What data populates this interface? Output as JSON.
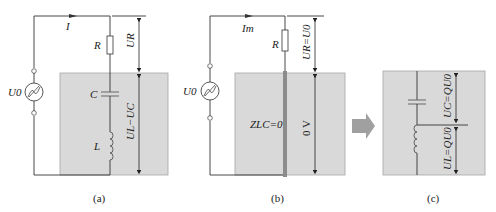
{
  "panels": [
    {
      "id": "a",
      "caption": "(a)",
      "current_label": "I",
      "source_label": "U0",
      "resistor_label": "R",
      "capacitor_label": "C",
      "inductor_label": "L",
      "voltage_top": "UR",
      "voltage_bottom": "UL−UC"
    },
    {
      "id": "b",
      "caption": "(b)",
      "current_label": "Im",
      "source_label": "U0",
      "resistor_label": "R",
      "impedance_label": "ZLC=0",
      "voltage_top": "UR=U0",
      "voltage_bottom": "0 V"
    },
    {
      "id": "c",
      "caption": "(c)",
      "voltage_top": "UC=QU0",
      "voltage_bottom": "UL=QU0"
    }
  ],
  "colors": {
    "shade": "#d9d9d9",
    "shade_border": "#a6a6a6",
    "wire": "#333333",
    "arrow": "#a0a0a0",
    "short_bar": "#8c8c8c"
  }
}
